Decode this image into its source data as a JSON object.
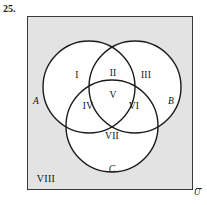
{
  "figure": {
    "problem_number": "25.",
    "type": "three-set Venn diagram",
    "universe": {
      "label": "U",
      "outside_region_label": "VIII",
      "fill_color": "#e3e3e3",
      "border_color": "#3a3a3a"
    },
    "sets": [
      {
        "id": "A",
        "label": "A",
        "position": "left circle"
      },
      {
        "id": "B",
        "label": "B",
        "position": "right circle"
      },
      {
        "id": "C",
        "label": "C",
        "position": "bottom circle"
      }
    ],
    "regions": [
      {
        "id": "I",
        "label": "I",
        "meaning": "A only"
      },
      {
        "id": "II",
        "label": "II",
        "meaning": "A and B only"
      },
      {
        "id": "III",
        "label": "III",
        "meaning": "B only"
      },
      {
        "id": "IV",
        "label": "IV",
        "meaning": "A and C only"
      },
      {
        "id": "V",
        "label": "V",
        "meaning": "A and B and C"
      },
      {
        "id": "VI",
        "label": "VI",
        "meaning": "B and C only"
      },
      {
        "id": "VII",
        "label": "VII",
        "meaning": "C only"
      },
      {
        "id": "VIII",
        "label": "VIII",
        "meaning": "outside all three sets"
      }
    ]
  }
}
